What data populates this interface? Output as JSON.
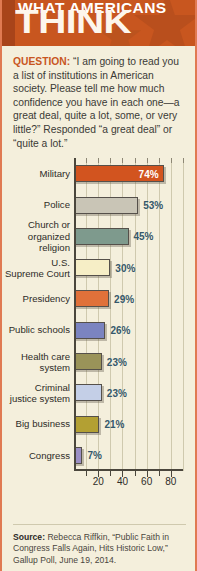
{
  "header": {
    "line1": "WHAT AMERICANS",
    "line2": "THINK",
    "bg_color": "#c8561f"
  },
  "question": {
    "label": "QUESTION:",
    "text": " “I am going to read you a list of institutions in American society. Please tell me how much confidence you have in each one—a great deal, quite a lot, some, or very little?” Responded “a great deal” or “quite a lot.”"
  },
  "chart_data": {
    "type": "bar",
    "orientation": "horizontal",
    "title": "WHAT AMERICANS THINK",
    "xlabel": "",
    "ylabel": "",
    "xlim": [
      0,
      90
    ],
    "grid": true,
    "legend": "none",
    "tick_labels": [
      "20",
      "40",
      "60",
      "80"
    ],
    "tick_values": [
      20,
      40,
      60,
      80
    ],
    "minor_tick_values": [
      10,
      30,
      50,
      70
    ],
    "categories": [
      "Military",
      "Police",
      "Church or organized religion",
      "U.S. Supreme Court",
      "Presidency",
      "Public schools",
      "Health care system",
      "Criminal justice system",
      "Big business",
      "Congress"
    ],
    "values": [
      74,
      53,
      45,
      30,
      29,
      26,
      23,
      23,
      21,
      7
    ],
    "value_labels": [
      "74%",
      "53%",
      "45%",
      "30%",
      "29%",
      "26%",
      "23%",
      "23%",
      "21%",
      "7%"
    ],
    "bar_colors": [
      "#d2541f",
      "#c9c5b6",
      "#7e9a8d",
      "#f6eec6",
      "#e0713a",
      "#7b84c0",
      "#9a9359",
      "#c4cfe7",
      "#b3a033",
      "#9b8fc4"
    ],
    "label_inside": [
      true,
      false,
      false,
      false,
      false,
      false,
      false,
      false,
      false,
      false
    ]
  },
  "categories_display": [
    "Military",
    "Police",
    "Church or<br>organized<br>religion",
    "U.S.<br>Supreme Court",
    "Presidency",
    "Public schools",
    "Health care<br>system",
    "Criminal<br>justice system",
    "Big business",
    "Congress"
  ],
  "source": {
    "label": "Source:",
    "text": " Rebecca Riffkin, “Public Faith in Congress Falls Again, Hits Historic Low,” Gallup Poll, June 19, 2014."
  }
}
